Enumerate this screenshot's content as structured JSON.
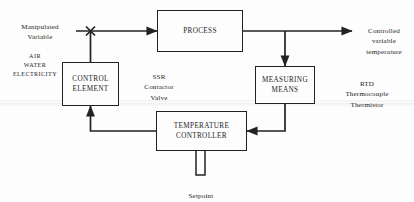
{
  "diagram": {
    "blocks": [
      {
        "id": "process",
        "label": "PROCESS"
      },
      {
        "id": "control_element",
        "label": "CONTROL\nELEMENT"
      },
      {
        "id": "measuring_means",
        "label": "MEASURING\nMEANS"
      },
      {
        "id": "temperature_controller",
        "label": "TEMPERATURE\nCONTROLLER"
      }
    ],
    "annotations": [
      {
        "id": "manipulated_variable",
        "label": "Manipulated\nVariable"
      },
      {
        "id": "utilities",
        "label": "AIR\nWATER\nELECTRICITY"
      },
      {
        "id": "final_control_devices",
        "label": "SSR\nContactor\nValve"
      },
      {
        "id": "controlled_variable",
        "label": "Controlled\nvariable\ntemperature"
      },
      {
        "id": "sensors",
        "label": "RTD\nThermocouple\nThermistor"
      },
      {
        "id": "setpoint",
        "label": "Setpoint"
      }
    ],
    "colors": {
      "line": "#222222",
      "background": "#fdfdfd",
      "text": "#1c1c1c"
    }
  }
}
